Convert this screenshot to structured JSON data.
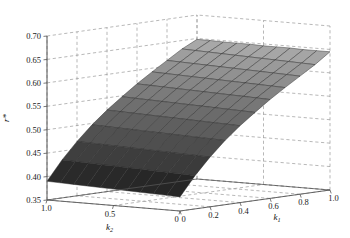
{
  "figure": {
    "type": "3d-surface-plot",
    "background": "#ffffff",
    "line_color": "#555555",
    "grid_color": "#9a9a9a",
    "surface_low_color": "#0a0a0a",
    "surface_high_color": "#c9c9c9"
  },
  "axes": {
    "z": {
      "label": "r*",
      "ticks": [
        "0.35",
        "0.40",
        "0.45",
        "0.50",
        "0.55",
        "0.60",
        "0.65",
        "0.70"
      ],
      "min": 0.35,
      "max": 0.7
    },
    "k1": {
      "label": "k",
      "sub": "1",
      "ticks": [
        "0",
        "0.2",
        "0.4",
        "0.6",
        "0.8",
        "1.0"
      ],
      "min": 0,
      "max": 1.0
    },
    "k2": {
      "label": "k",
      "sub": "2",
      "ticks": [
        "1.0",
        "0.5",
        "0"
      ],
      "min": 0,
      "max": 1.0
    }
  },
  "chart_data": {
    "type": "surface",
    "title": "",
    "xlabel": "k1",
    "ylabel": "k2",
    "zlabel": "r*",
    "xlim": [
      0,
      1.0
    ],
    "ylim": [
      0,
      1.0
    ],
    "zlim": [
      0.35,
      0.7
    ],
    "grid": true,
    "legend": "none",
    "colormap": "grayscale",
    "x": [
      0,
      0.1,
      0.2,
      0.3,
      0.4,
      0.5,
      0.6,
      0.7,
      0.8,
      0.9,
      1.0
    ],
    "y": [
      0,
      0.1,
      0.2,
      0.3,
      0.4,
      0.5,
      0.6,
      0.7,
      0.8,
      0.9,
      1.0
    ],
    "z": [
      [
        0.38,
        0.421,
        0.456,
        0.487,
        0.514,
        0.538,
        0.561,
        0.582,
        0.602,
        0.622,
        0.645
      ],
      [
        0.381,
        0.422,
        0.457,
        0.488,
        0.515,
        0.539,
        0.562,
        0.583,
        0.603,
        0.623,
        0.645
      ],
      [
        0.382,
        0.423,
        0.458,
        0.489,
        0.516,
        0.54,
        0.563,
        0.584,
        0.604,
        0.624,
        0.645
      ],
      [
        0.383,
        0.424,
        0.459,
        0.49,
        0.517,
        0.541,
        0.564,
        0.585,
        0.605,
        0.625,
        0.646
      ],
      [
        0.384,
        0.425,
        0.46,
        0.491,
        0.518,
        0.542,
        0.565,
        0.586,
        0.606,
        0.626,
        0.646
      ],
      [
        0.385,
        0.426,
        0.461,
        0.492,
        0.519,
        0.543,
        0.566,
        0.587,
        0.607,
        0.627,
        0.646
      ],
      [
        0.386,
        0.427,
        0.462,
        0.493,
        0.52,
        0.544,
        0.567,
        0.588,
        0.608,
        0.628,
        0.647
      ],
      [
        0.387,
        0.428,
        0.463,
        0.494,
        0.521,
        0.545,
        0.568,
        0.589,
        0.609,
        0.629,
        0.647
      ],
      [
        0.388,
        0.429,
        0.464,
        0.495,
        0.522,
        0.546,
        0.569,
        0.59,
        0.61,
        0.63,
        0.647
      ],
      [
        0.389,
        0.43,
        0.465,
        0.496,
        0.523,
        0.547,
        0.57,
        0.591,
        0.611,
        0.631,
        0.648
      ],
      [
        0.39,
        0.431,
        0.466,
        0.497,
        0.524,
        0.548,
        0.571,
        0.592,
        0.612,
        0.632,
        0.648
      ]
    ]
  }
}
